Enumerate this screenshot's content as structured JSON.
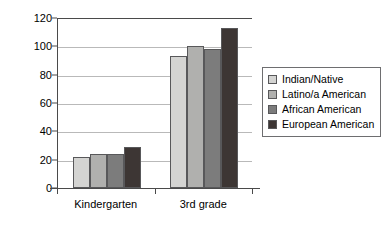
{
  "chart_data": {
    "type": "bar",
    "title": "",
    "subtitle": "",
    "xlabel": "",
    "ylabel": "",
    "categories": [
      "Kindergarten",
      "3rd grade"
    ],
    "series": [
      {
        "name": "Indian/Native",
        "values": [
          22,
          93
        ],
        "color": "#d4d4d2"
      },
      {
        "name": "Latino/a American",
        "values": [
          24,
          100
        ],
        "color": "#b0b0ae"
      },
      {
        "name": "African American",
        "values": [
          24,
          98
        ],
        "color": "#7c7c7c"
      },
      {
        "name": "European American",
        "values": [
          29,
          113
        ],
        "color": "#3d3634"
      }
    ],
    "ylim": [
      0,
      120
    ],
    "yticks": [
      0,
      20,
      40,
      60,
      80,
      100,
      120
    ],
    "ytick_labels": [
      "0",
      "20",
      "40",
      "60",
      "80",
      "100",
      "120"
    ],
    "grid": true,
    "legend_position": "right",
    "axis_color": "#4a4a4a",
    "grid_color": "#b9b9b9",
    "background": "#ffffff"
  }
}
